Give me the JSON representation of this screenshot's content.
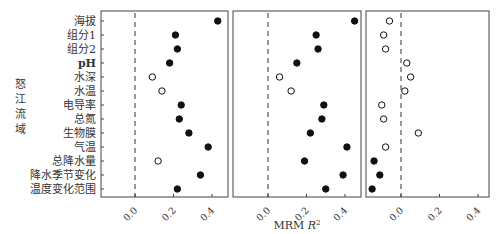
{
  "chart_data": {
    "type": "scatter",
    "title": "",
    "group_label": "怒江流域",
    "xlabel": "MRM R²",
    "xlabel_main": "MRM ",
    "xlabel_var": "R",
    "xlabel_sup": "2",
    "ylabel": "",
    "xlim": [
      -0.17,
      0.48
    ],
    "x_ticks": [
      0.0,
      0.2,
      0.4
    ],
    "x_tick_labels": [
      "0.0",
      "0.2",
      "0.4"
    ],
    "reference_line": 0.0,
    "categories": [
      "海拔",
      "组分1",
      "组分2",
      "pH",
      "水深",
      "水温",
      "电导率",
      "总氮",
      "生物膜",
      "气温",
      "总降水量",
      "降水季节变化",
      "温度变化范围"
    ],
    "marker_legend": {
      "filled": "significant",
      "open": "not significant"
    },
    "panels": [
      {
        "name": "panel-1",
        "values": [
          0.43,
          0.21,
          0.22,
          0.18,
          0.09,
          0.14,
          0.24,
          0.23,
          0.28,
          0.38,
          0.12,
          0.34,
          0.22
        ],
        "filled": [
          true,
          true,
          true,
          true,
          false,
          false,
          true,
          true,
          true,
          true,
          false,
          true,
          true
        ]
      },
      {
        "name": "panel-2",
        "values": [
          0.45,
          0.25,
          0.26,
          0.15,
          0.06,
          0.12,
          0.29,
          0.28,
          0.22,
          0.41,
          0.19,
          0.39,
          0.3
        ],
        "filled": [
          true,
          true,
          true,
          true,
          false,
          false,
          true,
          true,
          true,
          true,
          true,
          true,
          true
        ]
      },
      {
        "name": "panel-3",
        "values": [
          -0.06,
          -0.09,
          -0.08,
          0.03,
          0.05,
          0.02,
          -0.1,
          -0.09,
          0.09,
          -0.08,
          -0.14,
          -0.11,
          -0.15
        ],
        "filled": [
          false,
          false,
          false,
          false,
          false,
          false,
          false,
          false,
          false,
          false,
          true,
          true,
          true
        ]
      }
    ],
    "grid": false,
    "legend": "none"
  },
  "layout": {
    "panel_x": [
      [
        101,
        228
      ],
      [
        233,
        361
      ],
      [
        366,
        489
      ]
    ],
    "zero_x": [
      135,
      268,
      401
    ],
    "px_per_unit": 192.5,
    "plot_top": 11,
    "plot_bottom": 197,
    "row_y_start": 21,
    "row_step": 14
  }
}
